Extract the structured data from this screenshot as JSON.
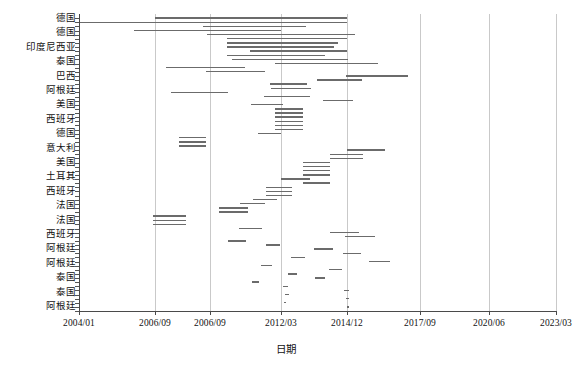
{
  "chart_data": {
    "type": "bar",
    "orientation": "horizontal",
    "subtype": "gantt-timeline",
    "title": "",
    "xlabel": "日期",
    "ylabel": "",
    "grid": "vertical-only",
    "legend": "none",
    "x_axis": {
      "tick_labels": [
        "2004/01",
        "2006/09",
        "2006/09",
        "2012/03",
        "2014/12",
        "2017/09",
        "2020/06",
        "2023/03"
      ],
      "tick_px": [
        79,
        155,
        210,
        281,
        347,
        420,
        489,
        556
      ],
      "range": [
        "2004/01",
        "2023/03"
      ]
    },
    "categories": [
      "德国",
      "德国",
      "印度尼西亚",
      "泰国",
      "巴西",
      "阿根廷",
      "美国",
      "西班牙",
      "德国",
      "意大利",
      "美国",
      "土耳其",
      "西班牙",
      "法国",
      "法国",
      "西班牙",
      "阿根廷",
      "阿根廷",
      "泰国",
      "泰国",
      "阿根廷"
    ],
    "bars": [
      {
        "row": 0,
        "x0": 155,
        "x1": 347,
        "label": "德国"
      },
      {
        "row": 1,
        "x0": 79,
        "x1": 347,
        "label": "德国"
      },
      {
        "row": 2,
        "x0": 203,
        "x1": 306,
        "label": "德国"
      },
      {
        "row": 3,
        "x0": 134,
        "x1": 281,
        "label": "德国"
      },
      {
        "row": 4,
        "x0": 207,
        "x1": 355,
        "label": "印度尼西亚"
      },
      {
        "row": 5,
        "x0": 227,
        "x1": 347,
        "label": "印度尼西亚"
      },
      {
        "row": 6,
        "x0": 227,
        "x1": 338,
        "label": "印度尼西亚"
      },
      {
        "row": 7,
        "x0": 227,
        "x1": 334,
        "label": "印度尼西亚"
      },
      {
        "row": 8,
        "x0": 250,
        "x1": 347,
        "label": "印度尼西亚"
      },
      {
        "row": 9,
        "x0": 227,
        "x1": 325,
        "label": "印度尼西亚"
      },
      {
        "row": 10,
        "x0": 232,
        "x1": 348,
        "label": "泰国"
      },
      {
        "row": 11,
        "x0": 275,
        "x1": 378,
        "label": "泰国"
      },
      {
        "row": 12,
        "x0": 166,
        "x1": 245,
        "label": "泰国"
      },
      {
        "row": 13,
        "x0": 206,
        "x1": 265,
        "label": "泰国"
      },
      {
        "row": 14,
        "x0": 346,
        "x1": 408,
        "label": "巴西"
      },
      {
        "row": 15,
        "x0": 317,
        "x1": 362,
        "label": "巴西"
      },
      {
        "row": 16,
        "x0": 270,
        "x1": 307,
        "label": "阿根廷"
      },
      {
        "row": 17,
        "x0": 271,
        "x1": 311,
        "label": "阿根廷"
      },
      {
        "row": 18,
        "x0": 171,
        "x1": 228,
        "label": "阿根廷"
      },
      {
        "row": 19,
        "x0": 264,
        "x1": 310,
        "label": "阿根廷"
      },
      {
        "row": 20,
        "x0": 323,
        "x1": 353,
        "label": "美国"
      },
      {
        "row": 21,
        "x0": 251,
        "x1": 283,
        "label": "美国"
      },
      {
        "row": 22,
        "x0": 275,
        "x1": 303,
        "label": "西班牙"
      },
      {
        "row": 23,
        "x0": 275,
        "x1": 303,
        "label": "西班牙"
      },
      {
        "row": 24,
        "x0": 275,
        "x1": 303,
        "label": "西班牙"
      },
      {
        "row": 25,
        "x0": 275,
        "x1": 303,
        "label": "西班牙"
      },
      {
        "row": 26,
        "x0": 275,
        "x1": 303,
        "label": "西班牙"
      },
      {
        "row": 27,
        "x0": 275,
        "x1": 303,
        "label": "西班牙"
      },
      {
        "row": 28,
        "x0": 258,
        "x1": 281,
        "label": "德国"
      },
      {
        "row": 29,
        "x0": 179,
        "x1": 206,
        "label": "德国"
      },
      {
        "row": 30,
        "x0": 179,
        "x1": 206,
        "label": "德国"
      },
      {
        "row": 31,
        "x0": 179,
        "x1": 206,
        "label": "德国"
      },
      {
        "row": 32,
        "x0": 347,
        "x1": 385,
        "label": "意大利"
      },
      {
        "row": 33,
        "x0": 330,
        "x1": 363,
        "label": "意大利"
      },
      {
        "row": 34,
        "x0": 330,
        "x1": 363,
        "label": "意大利"
      },
      {
        "row": 35,
        "x0": 303,
        "x1": 330,
        "label": "美国"
      },
      {
        "row": 36,
        "x0": 303,
        "x1": 330,
        "label": "美国"
      },
      {
        "row": 37,
        "x0": 303,
        "x1": 330,
        "label": "美国"
      },
      {
        "row": 38,
        "x0": 303,
        "x1": 330,
        "label": "美国"
      },
      {
        "row": 39,
        "x0": 281,
        "x1": 310,
        "label": "土耳其"
      },
      {
        "row": 40,
        "x0": 303,
        "x1": 330,
        "label": "土耳其"
      },
      {
        "row": 41,
        "x0": 266,
        "x1": 292,
        "label": "西班牙"
      },
      {
        "row": 42,
        "x0": 266,
        "x1": 292,
        "label": "西班牙"
      },
      {
        "row": 43,
        "x0": 266,
        "x1": 292,
        "label": "西班牙"
      },
      {
        "row": 44,
        "x0": 253,
        "x1": 277,
        "label": "法国"
      },
      {
        "row": 45,
        "x0": 240,
        "x1": 265,
        "label": "法国"
      },
      {
        "row": 46,
        "x0": 219,
        "x1": 248,
        "label": "法国"
      },
      {
        "row": 47,
        "x0": 219,
        "x1": 248,
        "label": "法国"
      },
      {
        "row": 48,
        "x0": 153,
        "x1": 186,
        "label": "西班牙"
      },
      {
        "row": 49,
        "x0": 153,
        "x1": 186,
        "label": "西班牙"
      },
      {
        "row": 50,
        "x0": 153,
        "x1": 186,
        "label": "西班牙"
      },
      {
        "row": 51,
        "x0": 239,
        "x1": 262,
        "label": "阿根廷"
      },
      {
        "row": 52,
        "x0": 330,
        "x1": 359,
        "label": "阿根廷"
      },
      {
        "row": 53,
        "x0": 345,
        "x1": 375,
        "label": "阿根廷"
      },
      {
        "row": 54,
        "x0": 228,
        "x1": 246,
        "label": "阿根廷"
      },
      {
        "row": 55,
        "x0": 266,
        "x1": 280,
        "label": "阿根廷"
      },
      {
        "row": 56,
        "x0": 314,
        "x1": 333,
        "label": "泰国"
      },
      {
        "row": 57,
        "x0": 343,
        "x1": 361,
        "label": "泰国"
      },
      {
        "row": 58,
        "x0": 291,
        "x1": 305,
        "label": "泰国"
      },
      {
        "row": 59,
        "x0": 369,
        "x1": 390,
        "label": "泰国"
      },
      {
        "row": 60,
        "x0": 261,
        "x1": 272,
        "label": "泰国"
      },
      {
        "row": 61,
        "x0": 329,
        "x1": 342,
        "label": "阿根廷"
      },
      {
        "row": 62,
        "x0": 288,
        "x1": 297,
        "label": "阿根廷"
      },
      {
        "row": 63,
        "x0": 315,
        "x1": 325,
        "label": "阿根廷"
      },
      {
        "row": 64,
        "x0": 252,
        "x1": 259,
        "label": "阿根廷"
      },
      {
        "row": 65,
        "x0": 283,
        "x1": 288,
        "label": "阿根廷"
      },
      {
        "row": 66,
        "x0": 344,
        "x1": 349,
        "label": "阿根廷"
      },
      {
        "row": 67,
        "x0": 285,
        "x1": 289,
        "label": "阿根廷"
      },
      {
        "row": 68,
        "x0": 346,
        "x1": 349,
        "label": "阿根廷"
      },
      {
        "row": 69,
        "x0": 284,
        "x1": 286,
        "label": "阿根廷"
      },
      {
        "row": 70,
        "x0": 347,
        "x1": 349,
        "label": "阿根廷"
      }
    ],
    "colors": {
      "bar": "#6b6b6b",
      "grid": "#c9c9c9",
      "axis": "#4a4a4a",
      "text": "#111111",
      "background": "#ffffff"
    }
  }
}
